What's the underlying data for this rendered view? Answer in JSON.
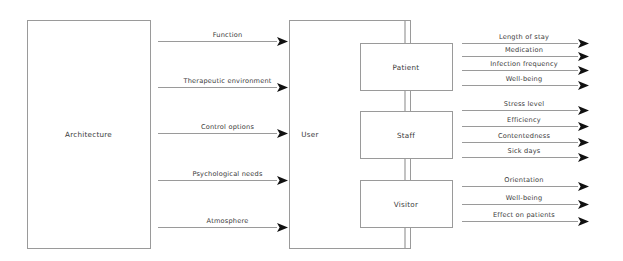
{
  "diagram": {
    "colors": {
      "box_stroke": "#9a9a9a",
      "line": "#9a9a9a",
      "arrow_head": "#111111",
      "text": "#3a3a3a",
      "background": "#ffffff"
    },
    "source_box": {
      "label": "Architecture",
      "x": 27,
      "y": 20,
      "w": 123,
      "h": 228
    },
    "user_box": {
      "label": "User",
      "x": 289,
      "y": 20,
      "w": 121,
      "h": 228,
      "label_x": 310,
      "label_y": 134
    },
    "inputs": [
      {
        "label": "Function",
        "y": 41,
        "x1": 158,
        "x2": 289
      },
      {
        "label": "Therapeutic environment",
        "y": 87,
        "x1": 158,
        "x2": 289
      },
      {
        "label": "Control options",
        "y": 133,
        "x1": 158,
        "x2": 289
      },
      {
        "label": "Psychological needs",
        "y": 180,
        "x1": 158,
        "x2": 289
      },
      {
        "label": "Atmosphere",
        "y": 227,
        "x1": 158,
        "x2": 289
      }
    ],
    "groups": [
      {
        "name": "patient",
        "box": {
          "label": "Patient",
          "x": 360,
          "y": 43,
          "w": 92,
          "h": 47
        },
        "outputs": [
          {
            "label": "Length of stay",
            "y": 43
          },
          {
            "label": "Medication",
            "y": 56
          },
          {
            "label": "Infection frequency",
            "y": 70
          },
          {
            "label": "Well-being",
            "y": 85
          }
        ]
      },
      {
        "name": "staff",
        "box": {
          "label": "Staff",
          "x": 360,
          "y": 111,
          "w": 92,
          "h": 47
        },
        "outputs": [
          {
            "label": "Stress level",
            "y": 110
          },
          {
            "label": "Efficiency",
            "y": 126
          },
          {
            "label": "Contentedness",
            "y": 142
          },
          {
            "label": "Sick days",
            "y": 157
          }
        ]
      },
      {
        "name": "visitor",
        "box": {
          "label": "Visitor",
          "x": 360,
          "y": 180,
          "w": 92,
          "h": 47
        },
        "outputs": [
          {
            "label": "Orientation",
            "y": 186
          },
          {
            "label": "Well-being",
            "y": 204
          },
          {
            "label": "Effect on patients",
            "y": 221
          }
        ]
      }
    ],
    "output_line": {
      "x1": 462,
      "x2": 578,
      "arrow_tip": 597
    },
    "spine": {
      "x": 405,
      "top": 20,
      "bottom": 248
    }
  }
}
